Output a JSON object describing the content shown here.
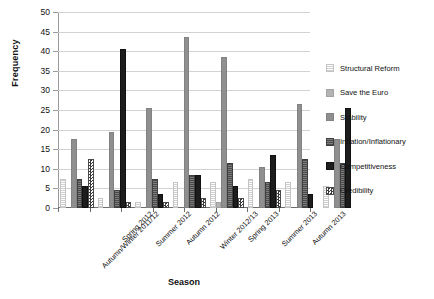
{
  "chart_data": {
    "type": "bar",
    "title": "",
    "xlabel": "Season",
    "ylabel": "Frequency",
    "ylim": [
      0,
      50
    ],
    "ytick_step": 5,
    "yticks": [
      50,
      45,
      40,
      35,
      30,
      25,
      20,
      15,
      10,
      5,
      0
    ],
    "grid": true,
    "legend_position": "right",
    "categories": [
      "Autumn/Winter 2011/12",
      "Spring 2012",
      "Summer 2012",
      "Autumn 2012",
      "Winter 2012/13",
      "Spring 2013",
      "Summer 2013",
      "Autumn 2013"
    ],
    "series": [
      {
        "name": "Structural Reform",
        "key": "structural",
        "values": [
          7,
          2,
          1,
          6,
          6,
          7,
          6,
          5
        ]
      },
      {
        "name": "Save the Euro",
        "key": "euro",
        "values": [
          0,
          0,
          0,
          0,
          1,
          0,
          0,
          0
        ]
      },
      {
        "name": "Stability",
        "key": "stability",
        "values": [
          17,
          19,
          25,
          43,
          38,
          10,
          26,
          17
        ]
      },
      {
        "name": "Inflation/Inflationary",
        "key": "inflation",
        "values": [
          7,
          4,
          7,
          8,
          11,
          6,
          12,
          11
        ]
      },
      {
        "name": "Competitiveness",
        "key": "competitiveness",
        "values": [
          5,
          40,
          3,
          8,
          5,
          13,
          3,
          25
        ]
      },
      {
        "name": "Credibility",
        "key": "credibility",
        "values": [
          12,
          1,
          1,
          2,
          2,
          4,
          0,
          0
        ]
      }
    ]
  },
  "legend": {
    "items": [
      {
        "label": "Structural Reform",
        "icon": "swatch-structural-reform"
      },
      {
        "label": "Save the Euro",
        "icon": "swatch-save-the-euro"
      },
      {
        "label": "Stability",
        "icon": "swatch-stability"
      },
      {
        "label": "Inflation/Inflationary",
        "icon": "swatch-inflation"
      },
      {
        "label": "Competitiveness",
        "icon": "swatch-competitiveness"
      },
      {
        "label": "Credibility",
        "icon": "swatch-credibility"
      }
    ]
  }
}
